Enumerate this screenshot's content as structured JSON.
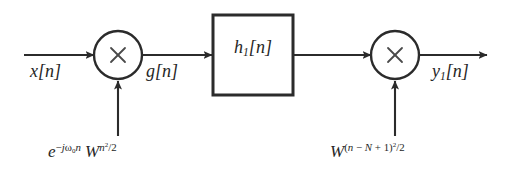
{
  "figure": {
    "type": "signal-flow-block-diagram",
    "background_color": "#ffffff",
    "line_color": "#2b2b2b",
    "text_color": "#262626"
  },
  "signals": {
    "input": {
      "label_plain": "x[n]",
      "symbol": "x",
      "index": "n"
    },
    "intermediate": {
      "label_plain": "g[n]",
      "symbol": "g",
      "index": "n"
    },
    "output": {
      "label_plain": "y1[n]",
      "symbol": "y",
      "subscript": "1",
      "index": "n"
    }
  },
  "blocks": {
    "filter": {
      "label_plain": "h1[n]",
      "symbol": "h",
      "subscript": "1",
      "index": "n"
    }
  },
  "multipliers": {
    "first": {
      "operator_glyph": "×",
      "name": "multiplier-1"
    },
    "second": {
      "operator_glyph": "×",
      "name": "multiplier-2"
    }
  },
  "expressions": {
    "left": {
      "plain": "e^(-jω0 n) W^(n^2/2)",
      "base1": "e",
      "exp1_sign": "−",
      "exp1_j": "j",
      "exp1_omega": "ω",
      "exp1_omega_sub": "0",
      "exp1_n": "n",
      "base2": "W",
      "exp2_n": "n",
      "exp2_pow": "2",
      "exp2_div": "/2"
    },
    "right": {
      "plain": "W^((n - N + 1)^2/2)",
      "base": "W",
      "exp_open": "(",
      "exp_n": "n",
      "exp_minus": "−",
      "exp_N": "N",
      "exp_plus": "+",
      "exp_one": "1",
      "exp_close": ")",
      "exp_pow": "2",
      "exp_div": "/2"
    }
  }
}
